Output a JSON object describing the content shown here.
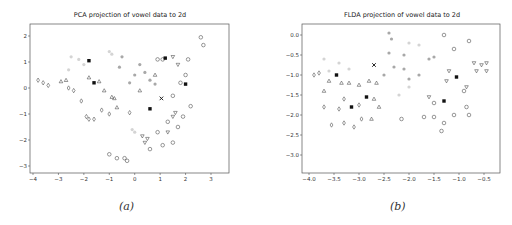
{
  "chart_data": [
    {
      "type": "scatter",
      "title": "PCA projection of vowel data to 2d",
      "caption": "(a)",
      "xlabel": "",
      "ylabel": "",
      "xlim": [
        -4.1,
        3.7
      ],
      "ylim": [
        -3.25,
        2.45
      ],
      "xticks": [
        "−4",
        "−3",
        "−2",
        "−1",
        "0",
        "1",
        "2",
        "3"
      ],
      "yticks": [
        "2",
        "1",
        "0",
        "−1",
        "−2",
        "−3"
      ],
      "grid": false,
      "legend": "none",
      "markers": [
        "o",
        "d",
        "^",
        "v",
        "s",
        "x",
        "*",
        "p",
        "h"
      ],
      "series": [
        {
          "name": "circles",
          "marker": "o",
          "points": [
            [
              2.6,
              1.95
            ],
            [
              2.7,
              1.65
            ],
            [
              2.1,
              1.1
            ],
            [
              2.0,
              0.5
            ],
            [
              1.8,
              0.2
            ],
            [
              1.5,
              -0.3
            ],
            [
              1.3,
              -1.3
            ],
            [
              1.1,
              -2.2
            ],
            [
              0.9,
              -1.7
            ],
            [
              0.6,
              -2.35
            ],
            [
              1.5,
              -2.1
            ],
            [
              1.7,
              -1.5
            ],
            [
              2.2,
              -0.7
            ],
            [
              1.9,
              -1.1
            ],
            [
              -1.0,
              -2.55
            ],
            [
              -0.7,
              -2.7
            ],
            [
              -0.4,
              -2.7
            ],
            [
              -0.3,
              -2.8
            ],
            [
              1.1,
              1.1
            ],
            [
              0.9,
              1.1
            ]
          ]
        },
        {
          "name": "diamonds",
          "marker": "d",
          "points": [
            [
              -3.8,
              0.3
            ],
            [
              -3.6,
              0.2
            ],
            [
              -3.4,
              0.1
            ],
            [
              -2.6,
              0.0
            ],
            [
              -2.4,
              -0.1
            ],
            [
              -1.9,
              -1.1
            ],
            [
              -1.8,
              -1.2
            ],
            [
              -1.6,
              -1.2
            ],
            [
              -2.1,
              -0.5
            ],
            [
              -1.3,
              -0.85
            ],
            [
              -1.0,
              -1.0
            ],
            [
              -0.2,
              -0.95
            ]
          ]
        },
        {
          "name": "triangles_up",
          "marker": "^",
          "points": [
            [
              -2.9,
              0.25
            ],
            [
              -2.7,
              0.3
            ],
            [
              -1.8,
              0.4
            ],
            [
              -1.4,
              0.25
            ],
            [
              -1.2,
              -0.1
            ],
            [
              -0.9,
              -0.35
            ],
            [
              -0.7,
              -0.75
            ],
            [
              0.2,
              -0.1
            ],
            [
              0.8,
              0.5
            ],
            [
              -0.8,
              -0.4
            ]
          ]
        },
        {
          "name": "triangles_down",
          "marker": "v",
          "points": [
            [
              0.5,
              -1.95
            ],
            [
              0.4,
              -2.1
            ],
            [
              0.3,
              -1.85
            ],
            [
              1.3,
              -1.7
            ],
            [
              1.5,
              -1.1
            ],
            [
              1.6,
              -0.95
            ],
            [
              1.7,
              0.9
            ],
            [
              1.5,
              1.2
            ]
          ]
        },
        {
          "name": "filled",
          "marker": "s",
          "points": [
            [
              2.0,
              0.15
            ],
            [
              -1.6,
              0.2
            ],
            [
              -1.8,
              1.05
            ],
            [
              1.2,
              1.15
            ],
            [
              0.6,
              -0.8
            ]
          ]
        },
        {
          "name": "x",
          "marker": "x",
          "points": [
            [
              1.05,
              -0.4
            ]
          ]
        },
        {
          "name": "light_gray",
          "marker": "o",
          "color": "#cccccc",
          "points": [
            [
              -2.5,
              1.2
            ],
            [
              -2.2,
              1.1
            ],
            [
              -2.0,
              0.9
            ],
            [
              -2.6,
              0.7
            ],
            [
              -1.0,
              1.4
            ],
            [
              -0.9,
              1.3
            ],
            [
              0.0,
              -1.7
            ],
            [
              -0.1,
              -1.6
            ]
          ]
        },
        {
          "name": "mid_gray",
          "marker": "o",
          "color": "#999999",
          "points": [
            [
              -0.5,
              1.2
            ],
            [
              -0.6,
              0.8
            ],
            [
              0.2,
              0.9
            ],
            [
              0.4,
              0.6
            ],
            [
              0.0,
              0.5
            ],
            [
              0.6,
              0.3
            ],
            [
              0.8,
              0.15
            ],
            [
              -0.2,
              0.2
            ]
          ]
        }
      ]
    },
    {
      "type": "scatter",
      "title": "FLDA projection of vowel data to 2d",
      "caption": "(b)",
      "xlabel": "",
      "ylabel": "",
      "xlim": [
        -4.15,
        -0.3
      ],
      "ylim": [
        -3.5,
        0.25
      ],
      "xticks": [
        "−4.0",
        "−3.5",
        "−3.0",
        "−2.5",
        "−2.0",
        "−1.5",
        "−1.0",
        "−0.5"
      ],
      "yticks": [
        "0.0",
        "−0.5",
        "−1.0",
        "−1.5",
        "−2.0",
        "−2.5",
        "−3.0"
      ],
      "grid": false,
      "legend": "none",
      "markers": [
        "o",
        "d",
        "^",
        "v",
        "s",
        "x",
        "*",
        "p",
        "h"
      ],
      "series": [
        {
          "name": "circles",
          "marker": "o",
          "points": [
            [
              -1.3,
              0.0
            ],
            [
              -1.1,
              -0.35
            ],
            [
              -0.8,
              -0.15
            ],
            [
              -0.9,
              -1.4
            ],
            [
              -0.85,
              -1.8
            ],
            [
              -0.8,
              -2.0
            ],
            [
              -1.1,
              -2.0
            ],
            [
              -1.3,
              -2.2
            ],
            [
              -1.35,
              -2.4
            ],
            [
              -1.5,
              -2.05
            ],
            [
              -1.7,
              -2.05
            ],
            [
              -1.5,
              -1.7
            ],
            [
              -2.15,
              -2.1
            ]
          ]
        },
        {
          "name": "diamonds",
          "marker": "d",
          "points": [
            [
              -3.9,
              -1.0
            ],
            [
              -3.8,
              -0.95
            ],
            [
              -3.7,
              -1.8
            ],
            [
              -3.55,
              -2.25
            ],
            [
              -3.3,
              -2.2
            ],
            [
              -3.1,
              -2.3
            ],
            [
              -2.95,
              -2.1
            ],
            [
              -3.3,
              -1.6
            ],
            [
              -3.4,
              -1.85
            ],
            [
              -3.0,
              -1.75
            ]
          ]
        },
        {
          "name": "triangles_up",
          "marker": "^",
          "points": [
            [
              -3.7,
              -1.4
            ],
            [
              -3.6,
              -1.15
            ],
            [
              -3.35,
              -1.2
            ],
            [
              -3.2,
              -1.2
            ],
            [
              -3.0,
              -1.25
            ],
            [
              -2.8,
              -1.15
            ],
            [
              -2.65,
              -1.2
            ],
            [
              -2.7,
              -1.6
            ],
            [
              -2.6,
              -1.8
            ],
            [
              -2.75,
              -2.1
            ]
          ]
        },
        {
          "name": "triangles_down",
          "marker": "v",
          "points": [
            [
              -0.7,
              -0.7
            ],
            [
              -0.55,
              -0.75
            ],
            [
              -0.45,
              -0.7
            ],
            [
              -0.45,
              -0.9
            ],
            [
              -0.65,
              -0.9
            ],
            [
              -1.2,
              -0.9
            ],
            [
              -1.25,
              -1.15
            ],
            [
              -0.85,
              -1.3
            ],
            [
              -1.6,
              -1.55
            ]
          ]
        },
        {
          "name": "filled",
          "marker": "s",
          "points": [
            [
              -3.45,
              -1.0
            ],
            [
              -1.3,
              -1.65
            ],
            [
              -2.85,
              -1.55
            ],
            [
              -3.15,
              -1.8
            ],
            [
              -1.05,
              -1.05
            ]
          ]
        },
        {
          "name": "x",
          "marker": "x",
          "points": [
            [
              -2.7,
              -0.75
            ]
          ]
        },
        {
          "name": "light_gray",
          "marker": "o",
          "color": "#cccccc",
          "points": [
            [
              -3.7,
              -0.6
            ],
            [
              -3.4,
              -0.7
            ],
            [
              -3.2,
              -0.85
            ],
            [
              -3.6,
              -0.9
            ],
            [
              -2.0,
              -0.2
            ],
            [
              -1.8,
              -0.25
            ],
            [
              -2.2,
              -1.5
            ],
            [
              -2.0,
              -1.3
            ]
          ]
        },
        {
          "name": "mid_gray",
          "marker": "o",
          "color": "#999999",
          "points": [
            [
              -2.4,
              0.05
            ],
            [
              -2.35,
              -0.1
            ],
            [
              -2.4,
              -0.45
            ],
            [
              -2.1,
              -0.5
            ],
            [
              -2.3,
              -0.8
            ],
            [
              -2.5,
              -1.0
            ],
            [
              -2.0,
              -1.1
            ],
            [
              -1.8,
              -1.0
            ],
            [
              -2.1,
              -0.85
            ],
            [
              -1.6,
              -0.6
            ],
            [
              -1.5,
              -0.55
            ]
          ]
        }
      ]
    }
  ],
  "panels": [
    {
      "title": "PCA projection of vowel data to 2d",
      "caption": "(a)"
    },
    {
      "title": "FLDA projection of vowel data to 2d",
      "caption": "(b)"
    }
  ]
}
